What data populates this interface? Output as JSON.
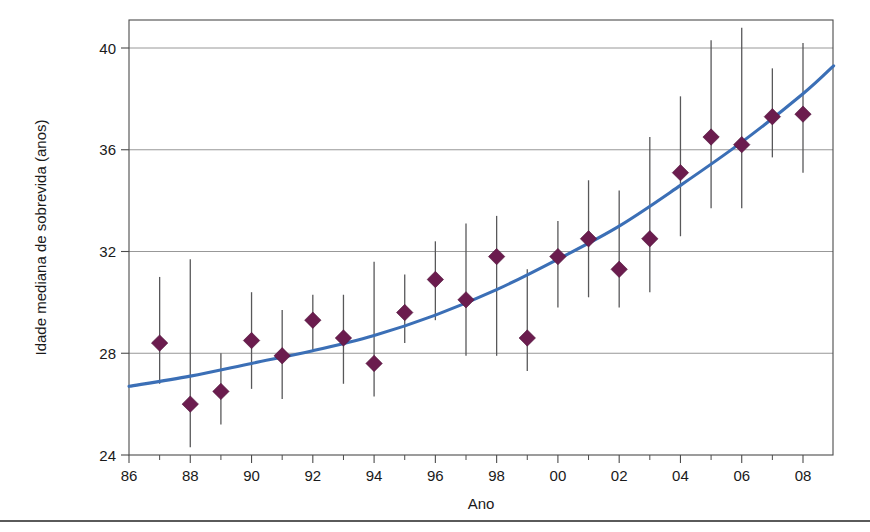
{
  "figure": {
    "background_color": "#ffffff",
    "frame_color": "#4c4c4c",
    "marker_color": "#6b1c4e",
    "line_color": "#3b6fb6",
    "errorbar_color": "#58585a"
  },
  "labels": {
    "xlabel": "Ano",
    "ylabel": "Idade mediana de sobrevida (anos)"
  },
  "ticks": {
    "y": [
      "24",
      "28",
      "32",
      "36",
      "40"
    ],
    "x": [
      "86",
      "88",
      "90",
      "92",
      "94",
      "96",
      "98",
      "00",
      "02",
      "04",
      "06",
      "08"
    ]
  },
  "chart_data": {
    "type": "scatter",
    "title": "",
    "xlabel": "Ano",
    "ylabel": "Idade mediana de sobrevida (anos)",
    "xlim": [
      86,
      109
    ],
    "ylim": [
      24,
      41
    ],
    "xtick_values": [
      86,
      88,
      90,
      92,
      94,
      96,
      98,
      100,
      102,
      104,
      106,
      108
    ],
    "xtick_labels": [
      "86",
      "88",
      "90",
      "92",
      "94",
      "96",
      "98",
      "00",
      "02",
      "04",
      "06",
      "08"
    ],
    "ytick_values": [
      24,
      28,
      32,
      36,
      40
    ],
    "ytick_labels": [
      "24",
      "28",
      "32",
      "36",
      "40"
    ],
    "grid": "horizontal",
    "legend": "none",
    "x": [
      87,
      88,
      89,
      90,
      91,
      92,
      93,
      94,
      95,
      96,
      97,
      98,
      99,
      100,
      101,
      102,
      103,
      104,
      105,
      106,
      107,
      108
    ],
    "values": [
      28.4,
      26.0,
      26.5,
      28.5,
      27.9,
      29.3,
      28.6,
      27.6,
      29.6,
      30.9,
      30.1,
      31.8,
      28.6,
      31.8,
      32.5,
      31.3,
      32.5,
      35.1,
      36.5,
      36.2,
      37.3,
      37.4
    ],
    "error_low": [
      26.8,
      24.3,
      25.2,
      26.6,
      26.2,
      28.1,
      26.8,
      26.3,
      28.4,
      29.3,
      27.9,
      27.9,
      27.3,
      29.8,
      30.2,
      29.8,
      30.4,
      32.6,
      33.7,
      33.7,
      35.7,
      35.1
    ],
    "error_high": [
      31.0,
      31.7,
      28.0,
      30.4,
      29.7,
      30.3,
      30.3,
      31.6,
      31.1,
      32.4,
      33.1,
      33.4,
      31.3,
      33.2,
      34.8,
      34.4,
      36.5,
      38.1,
      40.3,
      40.8,
      39.2,
      40.2
    ],
    "trendline": {
      "type": "fitted-curve",
      "x": [
        86,
        88,
        90,
        92,
        94,
        96,
        98,
        100,
        102,
        104,
        106,
        108,
        109
      ],
      "y": [
        26.7,
        27.1,
        27.6,
        28.1,
        28.7,
        29.5,
        30.5,
        31.7,
        33.0,
        34.6,
        36.3,
        38.2,
        39.3
      ]
    }
  }
}
